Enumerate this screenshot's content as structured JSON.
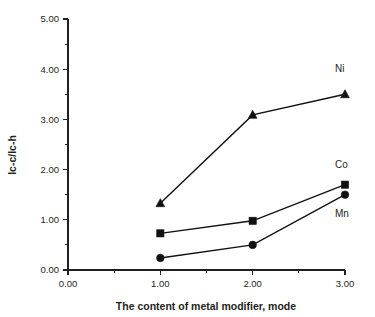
{
  "chart_data": {
    "type": "line",
    "title": "",
    "xlabel": "The content of metal modifier, mode",
    "ylabel": "Ic-c/Ic-h",
    "x": [
      1.0,
      2.0,
      3.0
    ],
    "xlim": [
      0.0,
      3.0
    ],
    "ylim": [
      0.0,
      5.0
    ],
    "grid": false,
    "legend_position": "inline-right",
    "xticks": [
      "0.00",
      "1.00",
      "2.00",
      "3.00"
    ],
    "xtick_values": [
      0.0,
      1.0,
      2.0,
      3.0
    ],
    "x_minor_step": 0.5,
    "yticks": [
      "0.00",
      "1.00",
      "2.00",
      "3.00",
      "4.00",
      "5.00"
    ],
    "ytick_values": [
      0.0,
      1.0,
      2.0,
      3.0,
      4.0,
      5.0
    ],
    "y_minor_step": 0.5,
    "series": [
      {
        "name": "Ni",
        "marker": "triangle",
        "color": "#111111",
        "values": [
          1.33,
          3.09,
          3.5
        ],
        "label_x": 3.0,
        "label_y": 3.95
      },
      {
        "name": "Co",
        "marker": "square",
        "color": "#111111",
        "values": [
          0.73,
          0.98,
          1.7
        ],
        "label_x": 3.0,
        "label_y": 2.03
      },
      {
        "name": "Mn",
        "marker": "circle",
        "color": "#111111",
        "values": [
          0.24,
          0.5,
          1.5
        ],
        "label_x": 3.0,
        "label_y": 1.06
      }
    ]
  }
}
